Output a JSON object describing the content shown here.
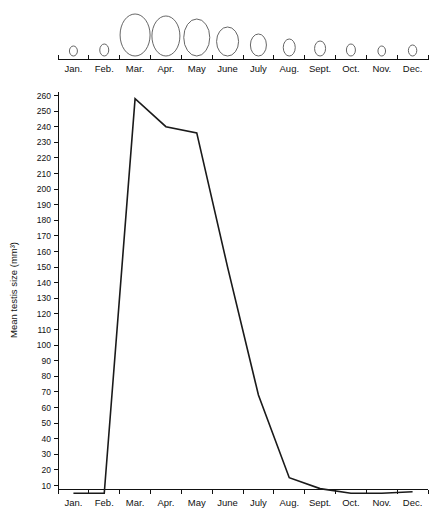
{
  "chart_data": {
    "type": "line",
    "title": "",
    "xlabel": "",
    "ylabel": "Mean testis size (mm³)",
    "categories": [
      "Jan.",
      "Feb.",
      "Mar.",
      "Apr.",
      "May",
      "June",
      "July",
      "Aug.",
      "Sept.",
      "Oct.",
      "Nov.",
      "Dec."
    ],
    "values": [
      5,
      5,
      258,
      240,
      236,
      150,
      68,
      15,
      8,
      5,
      5,
      6
    ],
    "ylim": [
      0,
      265
    ],
    "yticks": [
      10,
      20,
      30,
      40,
      50,
      60,
      70,
      80,
      90,
      100,
      110,
      120,
      130,
      140,
      150,
      160,
      170,
      180,
      190,
      200,
      210,
      220,
      230,
      240,
      250,
      260
    ],
    "grid": false,
    "legend": "none",
    "annotations": {
      "top_axis_label": "",
      "gonad_sizes_note": "Schematic testis outlines above top axis, scaled by month"
    },
    "series": [
      {
        "name": "Mean testis size (mm³)",
        "values": [
          5,
          5,
          258,
          240,
          236,
          150,
          68,
          15,
          8,
          5,
          5,
          6
        ]
      }
    ],
    "gonad_outlines": [
      {
        "month": "Jan.",
        "rx": 4.0,
        "ry": 5.0
      },
      {
        "month": "Feb.",
        "rx": 4.5,
        "ry": 6.0
      },
      {
        "month": "Mar.",
        "rx": 15.0,
        "ry": 21.0
      },
      {
        "month": "Apr.",
        "rx": 14.0,
        "ry": 20.0
      },
      {
        "month": "May",
        "rx": 13.0,
        "ry": 18.5
      },
      {
        "month": "June",
        "rx": 11.0,
        "ry": 14.5
      },
      {
        "month": "July",
        "rx": 8.0,
        "ry": 11.0
      },
      {
        "month": "Aug.",
        "rx": 6.0,
        "ry": 8.5
      },
      {
        "month": "Sept.",
        "rx": 5.5,
        "ry": 7.5
      },
      {
        "month": "Oct.",
        "rx": 4.5,
        "ry": 6.0
      },
      {
        "month": "Nov.",
        "rx": 3.8,
        "ry": 5.0
      },
      {
        "month": "Dec.",
        "rx": 4.2,
        "ry": 5.5
      }
    ]
  },
  "yaxis": {
    "title": "Mean testis size (mm³)",
    "labels": [
      "260",
      "250",
      "240",
      "230",
      "220",
      "210",
      "200",
      "190",
      "180",
      "170",
      "160",
      "150",
      "140",
      "130",
      "120",
      "110",
      "100",
      "90",
      "80",
      "70",
      "60",
      "50",
      "40",
      "30",
      "20",
      "10"
    ]
  },
  "xaxis_top": {
    "labels": [
      "Jan.",
      "Feb.",
      "Mar.",
      "Apr.",
      "May",
      "June",
      "July",
      "Aug.",
      "Sept.",
      "Oct.",
      "Nov.",
      "Dec."
    ]
  },
  "xaxis_bottom": {
    "labels": [
      "Jan.",
      "Feb.",
      "Mar.",
      "Apr.",
      "May",
      "June",
      "July",
      "Aug.",
      "Sept.",
      "Oct.",
      "Nov.",
      "Dec."
    ]
  }
}
